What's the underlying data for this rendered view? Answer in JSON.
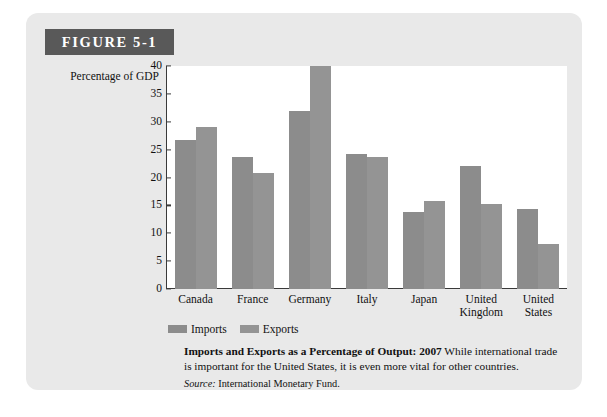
{
  "figure": {
    "banner_label": "FIGURE 5-1"
  },
  "chart_data": {
    "type": "bar",
    "title": "Imports and Exports as a Percentage of Output: 2007",
    "ylabel": "Percentage of GDP",
    "xlabel": "",
    "ylim": [
      0,
      40
    ],
    "ytick_values": [
      0,
      5,
      10,
      15,
      20,
      25,
      30,
      35,
      40
    ],
    "ytick_labels": [
      "0",
      "5",
      "10",
      "15",
      "20",
      "25",
      "30",
      "35",
      "40"
    ],
    "grid": false,
    "legend_position": "below-axis-left",
    "categories": [
      "Canada",
      "France",
      "Germany",
      "Italy",
      "Japan",
      "United Kingdom",
      "United States"
    ],
    "category_lines": [
      [
        "Canada"
      ],
      [
        "France"
      ],
      [
        "Germany"
      ],
      [
        "Italy"
      ],
      [
        "Japan"
      ],
      [
        "United",
        "Kingdom"
      ],
      [
        "United",
        "States"
      ]
    ],
    "series": [
      {
        "name": "Imports",
        "color": "#8c8c8c",
        "values": [
          26.8,
          23.7,
          32.0,
          24.3,
          13.9,
          22.0,
          14.3
        ]
      },
      {
        "name": "Exports",
        "color": "#949494",
        "values": [
          29.0,
          20.8,
          40.0,
          23.7,
          15.8,
          15.3,
          8.0
        ]
      }
    ]
  },
  "caption": {
    "bold_part": "Imports and Exports as a Percentage of Output: 2007",
    "body_part": "While international trade is important for the United States, it is even more vital for other countries.",
    "source_label": "Source:",
    "source_value": "International Monetary Fund."
  }
}
